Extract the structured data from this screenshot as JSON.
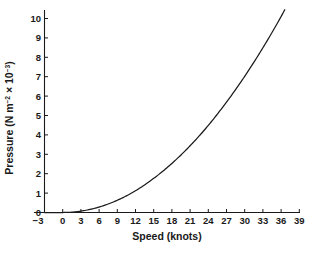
{
  "chart_data": {
    "type": "line",
    "title": "",
    "subtitle": "",
    "xlabel": "Speed (knots)",
    "ylabel": "Pressure (N m⁻² × 10⁻³)",
    "ylabel_parts": {
      "base": "Pressure (N m",
      "sup1": "−2",
      "mid": " × 10",
      "sup2": "−3",
      "tail": ")"
    },
    "xlim": [
      -3,
      39
    ],
    "ylim": [
      0,
      10.75
    ],
    "xticks": [
      -3,
      0,
      3,
      6,
      9,
      12,
      15,
      18,
      21,
      24,
      27,
      30,
      33,
      36,
      39
    ],
    "xtick_labels": [
      "−3",
      "0",
      "3",
      "6",
      "9",
      "12",
      "15",
      "18",
      "21",
      "24",
      "27",
      "30",
      "33",
      "36",
      "39"
    ],
    "yticks": [
      0,
      1,
      2,
      3,
      4,
      5,
      6,
      7,
      8,
      9,
      10
    ],
    "ytick_labels": [
      "0",
      "1",
      "2",
      "3",
      "4",
      "5",
      "6",
      "7",
      "8",
      "9",
      "10"
    ],
    "grid": false,
    "legend": null,
    "legend_position": "none",
    "axis_color": "#1a1a1a",
    "curve_color": "#1a1a1a",
    "background_color": "#ffffff",
    "series": [
      {
        "name": "Wind pressure",
        "relation": "P = 0.0078 × v²",
        "x": [
          -3,
          0,
          3,
          6,
          9,
          12,
          15,
          18,
          21,
          24,
          27,
          30,
          33,
          36,
          36.6
        ],
        "values": [
          0.0,
          0.0,
          0.07,
          0.28,
          0.63,
          1.12,
          1.76,
          2.53,
          3.44,
          4.49,
          5.69,
          7.02,
          8.49,
          10.1,
          10.45
        ]
      }
    ],
    "annotations": []
  }
}
